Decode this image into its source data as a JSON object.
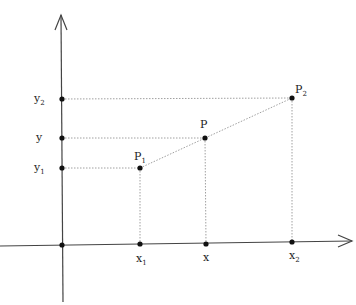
{
  "diagram": {
    "type": "coordinate-interpolation",
    "axes": {
      "origin": [
        62,
        245
      ],
      "x_axis_end": [
        352,
        242
      ],
      "y_axis_top": [
        61,
        14
      ],
      "y_axis_bottom": [
        63,
        302
      ]
    },
    "points": [
      {
        "id": "P1",
        "label": "P",
        "sub": "1",
        "x": 140,
        "y": 168
      },
      {
        "id": "P",
        "label": "P",
        "sub": "",
        "x": 205,
        "y": 138
      },
      {
        "id": "P2",
        "label": "P",
        "sub": "2",
        "x": 292,
        "y": 98
      }
    ],
    "x_ticks": [
      {
        "label": "x",
        "sub": "1",
        "x": 140
      },
      {
        "label": "x",
        "sub": "",
        "x": 206
      },
      {
        "label": "x",
        "sub": "2",
        "x": 292
      }
    ],
    "y_ticks": [
      {
        "label": "y",
        "sub": "2",
        "y": 99
      },
      {
        "label": "y",
        "sub": "",
        "y": 138
      },
      {
        "label": "y",
        "sub": "1",
        "y": 168
      }
    ],
    "colors": {
      "axis": "#444444",
      "guide": "#888888",
      "point": "#111111"
    }
  }
}
